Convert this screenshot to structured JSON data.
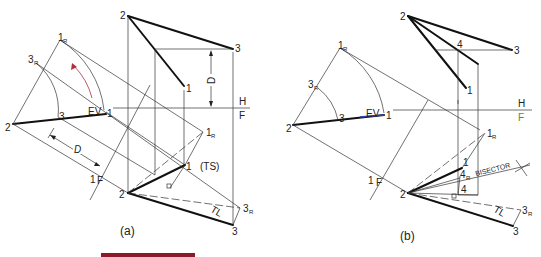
{
  "figure_a": {
    "caption": "(a)",
    "top_view": {
      "p2": "2",
      "p3": "3",
      "p1": "1",
      "dim": "D",
      "fold_h": "H",
      "fold_f": "F"
    },
    "front_view": {
      "p2": "2",
      "p1": "1",
      "p3": "3",
      "p1r": "1",
      "p1r_sub": "R",
      "p3r": "3",
      "p3r_sub": "R",
      "ts": "(TS)",
      "tl": "TL"
    },
    "aux_view": {
      "p2": "2",
      "p3": "3",
      "p1": "1",
      "ev": "EV",
      "p1r": "1",
      "p1r_sub": "R",
      "p3r": "3",
      "p3r_sub": "R",
      "dim": "D",
      "fold_1": "1",
      "fold_f": "F"
    }
  },
  "figure_b": {
    "caption": "(b)",
    "top_view": {
      "p2": "2",
      "p3": "3",
      "p1": "1",
      "p4": "4",
      "fold_h": "H",
      "fold_f": "F"
    },
    "front_view": {
      "p2": "2",
      "p1": "1",
      "p3": "3",
      "p4": "4",
      "p4r": "4",
      "p4r_sub": "R",
      "p1r": "1",
      "p1r_sub": "R",
      "p3r": "3",
      "p3r_sub": "R",
      "bisector": "BISECTOR",
      "tl": "TL"
    },
    "aux_view": {
      "p2": "2",
      "p3": "3",
      "p1": "1",
      "ev": "EV",
      "p1r": "1",
      "p1r_sub": "R",
      "p3r": "3",
      "p3r_sub": "R",
      "fold_1": "1",
      "fold_f": "F"
    }
  },
  "colors": {
    "line": "#111111",
    "arrow": "#b03040",
    "accent_green": "#3a9a3a",
    "accent_blue": "#3040c0",
    "bar": "#8b1a2b"
  }
}
